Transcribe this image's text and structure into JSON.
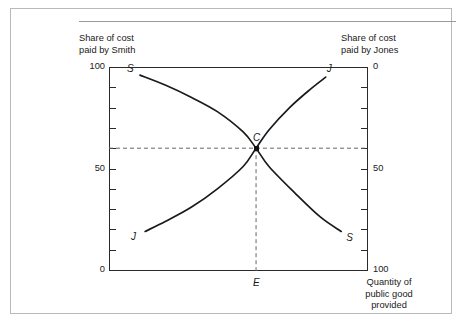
{
  "figure": {
    "left_caption": "Share of cost\npaid by Smith",
    "right_caption": "Share of cost\npaid by Jones",
    "x_caption": "Quantity of\npublic good\nprovided"
  },
  "axes": {
    "left_labels": [
      "100",
      "50",
      "0"
    ],
    "right_labels": [
      "0",
      "50",
      "100"
    ]
  },
  "annotations": {
    "s_upper": "S",
    "s_lower": "S",
    "j_upper": "J",
    "j_lower": "J",
    "equilibrium_point": "C",
    "equilibrium_quantity": "E"
  },
  "colors": {
    "curve": "#1a1a1a",
    "frame": "#2a2a2a",
    "guide": "#666666",
    "border": "#b9b9b9"
  },
  "chart_data": {
    "type": "line",
    "title": "",
    "xlabel": "Quantity of public good provided",
    "ylabel": "Share of cost paid by Smith",
    "ylabel_right": "Share of cost paid by Jones",
    "xlim": [
      0,
      100
    ],
    "ylim": [
      0,
      100
    ],
    "y_right_lim": [
      100,
      0
    ],
    "y_ticks": [
      0,
      10,
      20,
      30,
      40,
      50,
      60,
      70,
      80,
      90,
      100
    ],
    "y_tick_labels": [
      "0",
      "",
      "",
      "",
      "",
      "50",
      "",
      "",
      "",
      "",
      "100"
    ],
    "y_right_ticks": [
      0,
      10,
      20,
      30,
      40,
      50,
      60,
      70,
      80,
      90,
      100
    ],
    "y_right_tick_labels": [
      "0",
      "",
      "",
      "",
      "",
      "50",
      "",
      "",
      "",
      "",
      "100"
    ],
    "x_ticks": [],
    "grid": false,
    "legend": "none",
    "series": [
      {
        "name": "S",
        "label": "Smith demand curve (share of cost paid by Smith, falling)",
        "x": [
          12,
          22,
          32,
          42,
          52,
          57,
          62,
          72,
          82,
          90
        ],
        "y": [
          96,
          91,
          85,
          78,
          68,
          60,
          51,
          38,
          26,
          19
        ]
      },
      {
        "name": "J",
        "label": "Jones demand curve (share of cost paid by Smith, rising)",
        "x": [
          14,
          22,
          32,
          42,
          52,
          57,
          62,
          70,
          78,
          84
        ],
        "y": [
          19,
          24,
          31,
          40,
          51,
          60,
          69,
          80,
          89,
          95
        ]
      }
    ],
    "annotations": [
      {
        "text": "C",
        "x": 57,
        "y": 60,
        "note": "Lindahl equilibrium intersection"
      },
      {
        "text": "E",
        "x": 57,
        "y": 0,
        "note": "equilibrium quantity on x-axis"
      }
    ],
    "guides": [
      {
        "type": "hline",
        "y": 60,
        "style": "dashed"
      },
      {
        "type": "vline",
        "x": 57,
        "style": "dashed"
      }
    ]
  }
}
